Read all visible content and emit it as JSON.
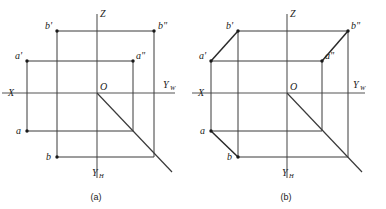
{
  "figure": {
    "background_color": "#ffffff",
    "line_color": "#3a3a3a",
    "axis_color": "#555555",
    "text_color": "#1a1a1a",
    "panels": [
      {
        "id": "a",
        "caption": "(a)",
        "caption_x": 96,
        "caption_y": 200,
        "description": "Three-view orthographic projection without connecting oblique edges",
        "origin": {
          "label": "O",
          "x": 97,
          "y": 93,
          "label_x": 100,
          "label_y": 90
        },
        "axes": [
          {
            "name": "X",
            "label": "X",
            "label_x": 8,
            "label_y": 96,
            "x1": 2,
            "y1": 93,
            "x2": 175,
            "y2": 93
          },
          {
            "name": "Yw",
            "label": "Y",
            "sub": "W",
            "label_x": 163,
            "label_y": 88,
            "sub_x": 170,
            "sub_y": 90
          },
          {
            "name": "Z",
            "label": "Z",
            "label_x": 100,
            "label_y": 17,
            "x1": 97,
            "y1": 14,
            "x2": 97,
            "y2": 178
          },
          {
            "name": "Yh",
            "label": "Y",
            "sub": "H",
            "label_x": 92,
            "label_y": 176,
            "sub_x": 99,
            "sub_y": 178
          }
        ],
        "points": [
          {
            "name": "b-prime",
            "label": "b",
            "prime": "'",
            "x": 57,
            "y": 31,
            "label_x": 45,
            "label_y": 29
          },
          {
            "name": "b-double-prime",
            "label": "b",
            "prime": "\"",
            "x": 154,
            "y": 31,
            "label_x": 158,
            "label_y": 29
          },
          {
            "name": "a-prime",
            "label": "a",
            "prime": "'",
            "x": 27,
            "y": 61,
            "label_x": 15,
            "label_y": 59
          },
          {
            "name": "a-double-prime",
            "label": "a",
            "prime": "\"",
            "x": 133,
            "y": 61,
            "label_x": 136,
            "label_y": 59
          },
          {
            "name": "a",
            "label": "a",
            "prime": "",
            "x": 27,
            "y": 131,
            "label_x": 16,
            "label_y": 134
          },
          {
            "name": "b",
            "label": "b",
            "prime": "",
            "x": 57,
            "y": 157,
            "label_x": 46,
            "label_y": 160
          }
        ],
        "diagonal": {
          "from_x": 97,
          "from_y": 93,
          "to_x": 172,
          "to_y": 172
        }
      },
      {
        "id": "b",
        "caption": "(b)",
        "caption_x": 286,
        "caption_y": 200,
        "description": "Same projection with oblique edges joining corresponding projections into a box",
        "origin": {
          "label": "O",
          "x": 287,
          "y": 93,
          "label_x": 290,
          "label_y": 90
        },
        "axes": [
          {
            "name": "X",
            "label": "X",
            "label_x": 198,
            "label_y": 96,
            "x1": 192,
            "y1": 93,
            "x2": 365,
            "y2": 93
          },
          {
            "name": "Yw",
            "label": "Y",
            "sub": "W",
            "label_x": 353,
            "label_y": 88,
            "sub_x": 360,
            "sub_y": 90
          },
          {
            "name": "Z",
            "label": "Z",
            "label_x": 290,
            "label_y": 17,
            "x1": 287,
            "y1": 14,
            "x2": 287,
            "y2": 178
          },
          {
            "name": "Yh",
            "label": "Y",
            "sub": "H",
            "label_x": 282,
            "label_y": 176,
            "sub_x": 289,
            "sub_y": 178
          }
        ],
        "points": [
          {
            "name": "b-prime",
            "label": "b",
            "prime": "'",
            "x": 238,
            "y": 31,
            "label_x": 226,
            "label_y": 29
          },
          {
            "name": "b-double-prime",
            "label": "b",
            "prime": "\"",
            "x": 348,
            "y": 31,
            "label_x": 351,
            "label_y": 29
          },
          {
            "name": "a-prime",
            "label": "a",
            "prime": "'",
            "x": 211,
            "y": 61,
            "label_x": 199,
            "label_y": 59
          },
          {
            "name": "a-double-prime",
            "label": "a",
            "prime": "\"",
            "x": 322,
            "y": 61,
            "label_x": 325,
            "label_y": 59
          },
          {
            "name": "a",
            "label": "a",
            "prime": "",
            "x": 211,
            "y": 131,
            "label_x": 200,
            "label_y": 134
          },
          {
            "name": "b",
            "label": "b",
            "prime": "",
            "x": 238,
            "y": 157,
            "label_x": 227,
            "label_y": 160
          }
        ],
        "diagonal": {
          "from_x": 287,
          "from_y": 93,
          "to_x": 362,
          "to_y": 172
        },
        "oblique_edges": [
          {
            "name": "a-prime-to-b-prime",
            "x1": 211,
            "y1": 61,
            "x2": 238,
            "y2": 31
          },
          {
            "name": "a-double-prime-to-b-double-prime",
            "x1": 322,
            "y1": 61,
            "x2": 348,
            "y2": 31
          },
          {
            "name": "a-to-b",
            "x1": 211,
            "y1": 131,
            "x2": 238,
            "y2": 157
          }
        ]
      }
    ]
  }
}
